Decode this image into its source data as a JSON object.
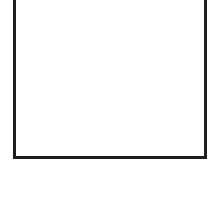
{
  "panel": {
    "border_color": "#1f1f1f",
    "background_color": "#ffffff",
    "content": ""
  }
}
